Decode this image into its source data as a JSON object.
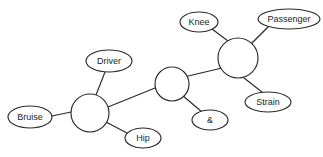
{
  "diagram": {
    "background_color": "#ffffff",
    "stroke_color": "#2a2a2a",
    "text_color": "#1c1c1c",
    "hubs": [
      {
        "id": "hub-left",
        "name": "hub-node-left",
        "cx": 90,
        "cy": 113,
        "r": 19
      },
      {
        "id": "hub-middle",
        "name": "hub-node-middle",
        "cx": 172,
        "cy": 84,
        "r": 17
      },
      {
        "id": "hub-right",
        "name": "hub-node-right",
        "cx": 238,
        "cy": 58,
        "r": 20
      }
    ],
    "leaves": [
      {
        "id": "leaf-bruise",
        "label": "Bruise",
        "cx": 30,
        "cy": 117,
        "rx": 22,
        "ry": 11,
        "font_size": 9
      },
      {
        "id": "leaf-driver",
        "label": "Driver",
        "cx": 109,
        "cy": 61,
        "rx": 23,
        "ry": 11,
        "font_size": 9
      },
      {
        "id": "leaf-hip",
        "label": "Hip",
        "cx": 143,
        "cy": 138,
        "rx": 18,
        "ry": 10,
        "font_size": 9
      },
      {
        "id": "leaf-amp",
        "label": "&",
        "cx": 210,
        "cy": 120,
        "rx": 18,
        "ry": 10,
        "font_size": 9
      },
      {
        "id": "leaf-knee",
        "label": "Knee",
        "cx": 199,
        "cy": 22,
        "rx": 19,
        "ry": 10,
        "font_size": 9
      },
      {
        "id": "leaf-passenger",
        "label": "Passenger",
        "cx": 289,
        "cy": 19,
        "rx": 31,
        "ry": 10,
        "font_size": 9
      },
      {
        "id": "leaf-strain",
        "label": "Strain",
        "cx": 268,
        "cy": 102,
        "rx": 23,
        "ry": 10,
        "font_size": 9
      }
    ],
    "edges": [
      {
        "id": "edge-bruise-hubleft",
        "from": "leaf-bruise",
        "to": "hub-left",
        "x1": 52,
        "y1": 116,
        "x2": 71,
        "y2": 112
      },
      {
        "id": "edge-driver-hubleft",
        "from": "leaf-driver",
        "to": "hub-left",
        "x1": 105,
        "y1": 72,
        "x2": 96,
        "y2": 95
      },
      {
        "id": "edge-hip-hubleft",
        "from": "leaf-hip",
        "to": "hub-left",
        "x1": 127,
        "y1": 133,
        "x2": 104,
        "y2": 121
      },
      {
        "id": "edge-hubleft-hubmiddle",
        "from": "hub-left",
        "to": "hub-middle",
        "x1": 108,
        "y1": 107,
        "x2": 155,
        "y2": 88
      },
      {
        "id": "edge-hubmiddle-amp",
        "from": "hub-middle",
        "to": "leaf-amp",
        "x1": 182,
        "y1": 95,
        "x2": 202,
        "y2": 112
      },
      {
        "id": "edge-hubmiddle-hubright",
        "from": "hub-middle",
        "to": "hub-right",
        "x1": 184,
        "y1": 77,
        "x2": 222,
        "y2": 68
      },
      {
        "id": "edge-knee-hubright",
        "from": "leaf-knee",
        "to": "hub-right",
        "x1": 212,
        "y1": 29,
        "x2": 228,
        "y2": 41
      },
      {
        "id": "edge-passenger-hubright",
        "from": "leaf-passenger",
        "to": "hub-right",
        "x1": 268,
        "y1": 27,
        "x2": 251,
        "y2": 44
      },
      {
        "id": "edge-strain-hubright",
        "from": "hub-right",
        "to": "leaf-strain",
        "x1": 244,
        "y1": 78,
        "x2": 262,
        "y2": 92
      }
    ]
  }
}
